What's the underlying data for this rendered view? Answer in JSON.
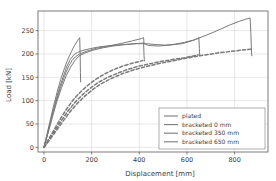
{
  "chart_data": {
    "type": "line",
    "title": "",
    "xlabel": "Displacement [mm]",
    "ylabel": "Load [kN]",
    "xlim": [
      -25,
      940
    ],
    "ylim": [
      -10,
      292
    ],
    "xticks": [
      0,
      200,
      400,
      600,
      800
    ],
    "yticks": [
      0,
      50,
      100,
      150,
      200,
      250
    ],
    "grid": true,
    "legend_position": "lower right",
    "legend_entries": [
      "plated",
      "bracketed 0 mm",
      "bracketed 350 mm",
      "bracketed 650 mm"
    ],
    "line_color": "#7a7a7a",
    "series": [
      {
        "name": "plated",
        "style": "solid",
        "points": [
          [
            0,
            0
          ],
          [
            10,
            22
          ],
          [
            25,
            55
          ],
          [
            40,
            88
          ],
          [
            55,
            118
          ],
          [
            70,
            145
          ],
          [
            85,
            168
          ],
          [
            100,
            188
          ],
          [
            115,
            205
          ],
          [
            128,
            218
          ],
          [
            140,
            228
          ],
          [
            150,
            235
          ],
          [
            152,
            196
          ],
          [
            153,
            160
          ],
          [
            154,
            140
          ]
        ]
      },
      {
        "name": "bracketed 0 mm",
        "style": "solid",
        "points": [
          [
            0,
            0
          ],
          [
            12,
            24
          ],
          [
            28,
            58
          ],
          [
            45,
            92
          ],
          [
            62,
            122
          ],
          [
            80,
            150
          ],
          [
            95,
            172
          ],
          [
            110,
            188
          ],
          [
            125,
            198
          ],
          [
            140,
            203
          ],
          [
            160,
            207
          ],
          [
            190,
            211
          ],
          [
            230,
            215
          ],
          [
            280,
            218
          ],
          [
            330,
            220
          ],
          [
            380,
            222
          ],
          [
            410,
            223
          ],
          [
            418,
            224
          ],
          [
            420,
            196
          ],
          [
            421,
            188
          ],
          [
            422,
            185
          ]
        ]
      },
      {
        "name": "bracketed 0 mm dashed",
        "style": "dashed",
        "points": [
          [
            0,
            0
          ],
          [
            20,
            18
          ],
          [
            45,
            40
          ],
          [
            70,
            62
          ],
          [
            95,
            82
          ],
          [
            120,
            100
          ],
          [
            150,
            117
          ],
          [
            180,
            131
          ],
          [
            215,
            145
          ],
          [
            250,
            156
          ],
          [
            290,
            166
          ],
          [
            330,
            174
          ],
          [
            370,
            180
          ],
          [
            400,
            184
          ],
          [
            415,
            186
          ]
        ]
      },
      {
        "name": "bracketed 350 mm",
        "style": "solid",
        "points": [
          [
            0,
            0
          ],
          [
            14,
            26
          ],
          [
            32,
            62
          ],
          [
            50,
            96
          ],
          [
            68,
            126
          ],
          [
            86,
            152
          ],
          [
            102,
            172
          ],
          [
            118,
            186
          ],
          [
            132,
            194
          ],
          [
            150,
            200
          ],
          [
            180,
            206
          ],
          [
            220,
            212
          ],
          [
            270,
            217
          ],
          [
            320,
            222
          ],
          [
            370,
            228
          ],
          [
            410,
            233
          ],
          [
            418,
            235
          ],
          [
            420,
            222
          ],
          [
            440,
            218
          ],
          [
            480,
            217
          ],
          [
            530,
            219
          ],
          [
            580,
            222
          ],
          [
            620,
            228
          ],
          [
            645,
            233
          ],
          [
            650,
            235
          ],
          [
            652,
            212
          ],
          [
            653,
            200
          ],
          [
            654,
            196
          ]
        ]
      },
      {
        "name": "bracketed 350 mm dashed",
        "style": "dashed",
        "points": [
          [
            0,
            0
          ],
          [
            22,
            17
          ],
          [
            48,
            38
          ],
          [
            74,
            58
          ],
          [
            100,
            77
          ],
          [
            128,
            95
          ],
          [
            158,
            111
          ],
          [
            192,
            126
          ],
          [
            228,
            139
          ],
          [
            268,
            150
          ],
          [
            310,
            159
          ],
          [
            352,
            167
          ],
          [
            398,
            174
          ],
          [
            445,
            179
          ],
          [
            490,
            184
          ],
          [
            540,
            188
          ],
          [
            590,
            192
          ],
          [
            630,
            196
          ],
          [
            648,
            198
          ]
        ]
      },
      {
        "name": "bracketed 650 mm",
        "style": "solid",
        "points": [
          [
            0,
            0
          ],
          [
            16,
            28
          ],
          [
            35,
            64
          ],
          [
            54,
            98
          ],
          [
            74,
            128
          ],
          [
            94,
            154
          ],
          [
            112,
            172
          ],
          [
            130,
            186
          ],
          [
            148,
            196
          ],
          [
            172,
            202
          ],
          [
            205,
            208
          ],
          [
            245,
            213
          ],
          [
            290,
            217
          ],
          [
            340,
            220
          ],
          [
            390,
            222
          ],
          [
            430,
            222
          ],
          [
            470,
            220
          ],
          [
            510,
            219
          ],
          [
            550,
            221
          ],
          [
            590,
            225
          ],
          [
            630,
            230
          ],
          [
            660,
            236
          ],
          [
            700,
            244
          ],
          [
            740,
            253
          ],
          [
            780,
            262
          ],
          [
            820,
            270
          ],
          [
            850,
            275
          ],
          [
            865,
            277
          ],
          [
            868,
            246
          ],
          [
            870,
            215
          ],
          [
            872,
            196
          ]
        ]
      },
      {
        "name": "bracketed 650 mm dashed",
        "style": "dashed",
        "points": [
          [
            0,
            0
          ],
          [
            24,
            16
          ],
          [
            52,
            36
          ],
          [
            80,
            56
          ],
          [
            108,
            75
          ],
          [
            138,
            93
          ],
          [
            170,
            109
          ],
          [
            205,
            124
          ],
          [
            243,
            137
          ],
          [
            285,
            148
          ],
          [
            330,
            158
          ],
          [
            378,
            166
          ],
          [
            428,
            173
          ],
          [
            478,
            179
          ],
          [
            528,
            184
          ],
          [
            578,
            189
          ],
          [
            628,
            194
          ],
          [
            678,
            198
          ],
          [
            728,
            202
          ],
          [
            778,
            205
          ],
          [
            828,
            208
          ],
          [
            868,
            210
          ]
        ]
      }
    ]
  }
}
